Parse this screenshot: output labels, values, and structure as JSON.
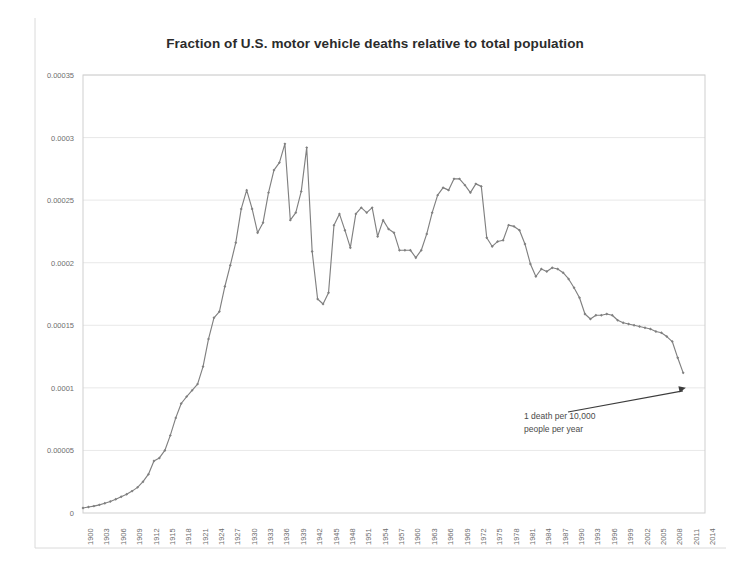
{
  "chart_data": {
    "type": "line",
    "title": "Fraction of U.S. motor vehicle deaths relative to total population",
    "xlabel": "",
    "ylabel": "",
    "xlim": [
      1900,
      2014
    ],
    "ylim": [
      0,
      0.00035
    ],
    "grid": true,
    "legend": false,
    "legend_position": "none",
    "line_color": "#808080",
    "marker": "diamond",
    "marker_color": "#808080",
    "ytick_labels": [
      "0",
      "0.00005",
      "0.0001",
      "0.00015",
      "0.0002",
      "0.00025",
      "0.0003",
      "0.00035"
    ],
    "ytick_values": [
      0,
      5e-05,
      0.0001,
      0.00015,
      0.0002,
      0.00025,
      0.0003,
      0.00035
    ],
    "xtick_labels": [
      "1900",
      "1903",
      "1906",
      "1909",
      "1912",
      "1915",
      "1918",
      "1921",
      "1924",
      "1927",
      "1930",
      "1933",
      "1936",
      "1939",
      "1942",
      "1945",
      "1948",
      "1951",
      "1954",
      "1957",
      "1960",
      "1963",
      "1966",
      "1969",
      "1972",
      "1975",
      "1978",
      "1981",
      "1984",
      "1987",
      "1990",
      "1993",
      "1996",
      "1999",
      "2002",
      "2005",
      "2008",
      "2011",
      "2014"
    ],
    "xtick_values": [
      1900,
      1903,
      1906,
      1909,
      1912,
      1915,
      1918,
      1921,
      1924,
      1927,
      1930,
      1933,
      1936,
      1939,
      1942,
      1945,
      1948,
      1951,
      1954,
      1957,
      1960,
      1963,
      1966,
      1969,
      1972,
      1975,
      1978,
      1981,
      1984,
      1987,
      1990,
      1993,
      1996,
      1999,
      2002,
      2005,
      2008,
      2011,
      2014
    ],
    "x": [
      1900,
      1901,
      1902,
      1903,
      1904,
      1905,
      1906,
      1907,
      1908,
      1909,
      1910,
      1911,
      1912,
      1913,
      1914,
      1915,
      1916,
      1917,
      1918,
      1919,
      1920,
      1921,
      1922,
      1923,
      1924,
      1925,
      1926,
      1927,
      1928,
      1929,
      1930,
      1931,
      1932,
      1933,
      1934,
      1935,
      1936,
      1937,
      1938,
      1939,
      1940,
      1941,
      1942,
      1943,
      1944,
      1945,
      1946,
      1947,
      1948,
      1949,
      1950,
      1951,
      1952,
      1953,
      1954,
      1955,
      1956,
      1957,
      1958,
      1959,
      1960,
      1961,
      1962,
      1963,
      1964,
      1965,
      1966,
      1967,
      1968,
      1969,
      1970,
      1971,
      1972,
      1973,
      1974,
      1975,
      1976,
      1977,
      1978,
      1979,
      1980,
      1981,
      1982,
      1983,
      1984,
      1985,
      1986,
      1987,
      1988,
      1989,
      1990,
      1991,
      1992,
      1993,
      1994,
      1995,
      1996,
      1997,
      1998,
      1999,
      2000,
      2001,
      2002,
      2003,
      2004,
      2005,
      2006,
      2007,
      2008,
      2009,
      2010
    ],
    "values": [
      4e-06,
      4.8e-06,
      5.5e-06,
      6.5e-06,
      7.8e-06,
      9.2e-06,
      1.1e-05,
      1.3e-05,
      1.5e-05,
      1.75e-05,
      2.05e-05,
      2.5e-05,
      3.1e-05,
      4.15e-05,
      4.4e-05,
      5e-05,
      6.2e-05,
      7.6e-05,
      8.75e-05,
      9.3e-05,
      9.8e-05,
      0.000103,
      0.000117,
      0.000139,
      0.000156,
      0.000161,
      0.000181,
      0.000198,
      0.000216,
      0.000243,
      0.000258,
      0.000243,
      0.000224,
      0.000232,
      0.000256,
      0.000274,
      0.00028,
      0.000295,
      0.000234,
      0.00024,
      0.000257,
      0.000292,
      0.000209,
      0.000171,
      0.000167,
      0.000176,
      0.00023,
      0.000239,
      0.000226,
      0.000212,
      0.000239,
      0.000244,
      0.00024,
      0.000244,
      0.000221,
      0.000234,
      0.000227,
      0.000224,
      0.00021,
      0.00021,
      0.00021,
      0.000204,
      0.00021,
      0.000223,
      0.00024,
      0.000254,
      0.00026,
      0.000258,
      0.000267,
      0.000267,
      0.000262,
      0.000256,
      0.000263,
      0.000261,
      0.00022,
      0.000213,
      0.000217,
      0.000218,
      0.00023,
      0.000229,
      0.000226,
      0.000215,
      0.000199,
      0.000189,
      0.000195,
      0.000193,
      0.000196,
      0.000195,
      0.000192,
      0.000187,
      0.00018,
      0.000172,
      0.000159,
      0.000155,
      0.000158,
      0.000158,
      0.000159,
      0.000158,
      0.000154,
      0.000152,
      0.000151,
      0.00015,
      0.000149,
      0.000148,
      0.000147,
      0.000145,
      0.000144,
      0.000141,
      0.000137,
      0.000124,
      0.000112
    ],
    "annotations": [
      {
        "name": "one-death-per-10000",
        "lines": [
          "1 death per 10,000",
          "people per year"
        ],
        "target_value": 0.0001,
        "target_x": 2010.5
      }
    ]
  }
}
